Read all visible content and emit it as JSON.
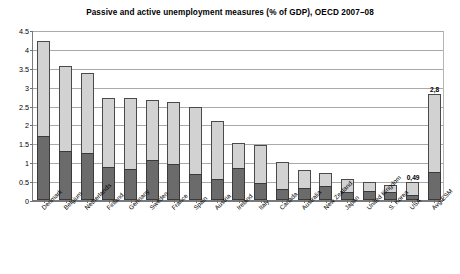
{
  "chart_data": {
    "type": "bar",
    "title": "Passive and active unemployment measures (% of GDP), OECD 2007–08",
    "xlabel": "",
    "ylabel": "",
    "ylim": [
      0,
      4.5
    ],
    "ytick_step": 0.5,
    "grid": true,
    "stacked": true,
    "legend_position": "top-center",
    "yticks": [
      "0",
      "0.5",
      "1",
      "1.5",
      "2",
      "2.5",
      "3",
      "3.5",
      "4",
      "4.5"
    ],
    "categories": [
      "Denmark",
      "Belgium",
      "Netherlands",
      "Finland",
      "Germany",
      "Sweden",
      "France",
      "Spain",
      "Austria",
      "Ireland",
      "Italy",
      "Canada",
      "Australia",
      "New Zealand",
      "Japan",
      "United Kingdom",
      "S. Korea",
      "USA",
      "Avg ESM"
    ],
    "series": [
      {
        "name": "active",
        "color": "#6b6b6b",
        "values": [
          1.7,
          1.3,
          1.25,
          0.88,
          0.82,
          1.05,
          0.95,
          0.68,
          0.55,
          0.85,
          0.45,
          0.3,
          0.32,
          0.38,
          0.22,
          0.25,
          0.2,
          0.13,
          0.75
        ]
      },
      {
        "name": "passive",
        "color": "#d2d2d2",
        "values": [
          2.5,
          2.25,
          2.1,
          1.82,
          1.88,
          1.6,
          1.65,
          1.77,
          1.55,
          0.65,
          1.0,
          0.7,
          0.48,
          0.34,
          0.33,
          0.23,
          0.2,
          0.36,
          2.05
        ]
      }
    ],
    "totals": [
      4.2,
      3.55,
      3.35,
      2.7,
      2.7,
      2.65,
      2.6,
      2.45,
      2.1,
      1.5,
      1.45,
      1.0,
      0.8,
      0.72,
      0.55,
      0.48,
      0.4,
      0.49,
      2.8
    ],
    "data_labels": [
      {
        "category": "USA",
        "text": "0,49"
      },
      {
        "category": "Avg ESM",
        "text": "2,8"
      }
    ],
    "legend": [
      {
        "label": "active",
        "color": "#6b6b6b"
      },
      {
        "label": "passive",
        "color": "#d2d2d2"
      }
    ]
  }
}
